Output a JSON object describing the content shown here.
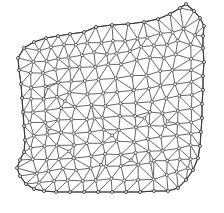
{
  "figure": {
    "title": "",
    "caption": "",
    "background_color": "#ffffff",
    "width": 224,
    "height": 213
  },
  "style": {
    "edge_color": "#4a4a4a",
    "boundary_edge_color": "#3a3a3a",
    "node_fill": "#ffffff",
    "node_stroke": "#333333",
    "edge_width": 0.85,
    "node_radius": 1.5
  },
  "chart_data": {
    "type": "scatter",
    "title": "",
    "xlabel": "",
    "ylabel": "",
    "grid": false,
    "legend": false,
    "xlim": [
      0,
      224
    ],
    "ylim": [
      0,
      213
    ],
    "node_count": 268,
    "boundary": [
      [
        84,
        32
      ],
      [
        96,
        27
      ],
      [
        112,
        25
      ],
      [
        128,
        24
      ],
      [
        144,
        22
      ],
      [
        158,
        19
      ],
      [
        170,
        14
      ],
      [
        180,
        8
      ],
      [
        186,
        4
      ],
      [
        194,
        11
      ],
      [
        200,
        18
      ],
      [
        204,
        26
      ],
      [
        203,
        36
      ],
      [
        203,
        48
      ],
      [
        204,
        62
      ],
      [
        203,
        76
      ],
      [
        203,
        90
      ],
      [
        202,
        104
      ],
      [
        202,
        118
      ],
      [
        201,
        132
      ],
      [
        200,
        146
      ],
      [
        198,
        158
      ],
      [
        193,
        170
      ],
      [
        186,
        180
      ],
      [
        178,
        188
      ],
      [
        168,
        191
      ],
      [
        154,
        191
      ],
      [
        140,
        192
      ],
      [
        126,
        192
      ],
      [
        112,
        192
      ],
      [
        98,
        192
      ],
      [
        84,
        192
      ],
      [
        70,
        192
      ],
      [
        56,
        192
      ],
      [
        44,
        191
      ],
      [
        34,
        189
      ],
      [
        26,
        184
      ],
      [
        20,
        176
      ],
      [
        17,
        168
      ],
      [
        20,
        160
      ],
      [
        24,
        152
      ],
      [
        25,
        140
      ],
      [
        24,
        126
      ],
      [
        23,
        112
      ],
      [
        22,
        98
      ],
      [
        21,
        84
      ],
      [
        19,
        70
      ],
      [
        18,
        58
      ],
      [
        24,
        48
      ],
      [
        34,
        42
      ],
      [
        46,
        38
      ],
      [
        58,
        36
      ],
      [
        70,
        34
      ]
    ],
    "interior_nodes": [
      [
        40,
        52
      ],
      [
        52,
        48
      ],
      [
        64,
        46
      ],
      [
        76,
        44
      ],
      [
        88,
        43
      ],
      [
        100,
        42
      ],
      [
        112,
        41
      ],
      [
        124,
        40
      ],
      [
        136,
        38
      ],
      [
        148,
        36
      ],
      [
        160,
        34
      ],
      [
        172,
        31
      ],
      [
        184,
        28
      ],
      [
        194,
        34
      ],
      [
        34,
        62
      ],
      [
        46,
        60
      ],
      [
        58,
        58
      ],
      [
        70,
        56
      ],
      [
        82,
        55
      ],
      [
        94,
        54
      ],
      [
        106,
        53
      ],
      [
        118,
        52
      ],
      [
        130,
        50
      ],
      [
        142,
        48
      ],
      [
        154,
        46
      ],
      [
        166,
        44
      ],
      [
        178,
        42
      ],
      [
        190,
        46
      ],
      [
        30,
        74
      ],
      [
        42,
        72
      ],
      [
        56,
        70
      ],
      [
        68,
        68
      ],
      [
        80,
        67
      ],
      [
        94,
        66
      ],
      [
        108,
        65
      ],
      [
        122,
        63
      ],
      [
        136,
        61
      ],
      [
        150,
        59
      ],
      [
        164,
        57
      ],
      [
        176,
        55
      ],
      [
        190,
        58
      ],
      [
        32,
        88
      ],
      [
        44,
        85
      ],
      [
        58,
        83
      ],
      [
        72,
        81
      ],
      [
        86,
        80
      ],
      [
        100,
        79
      ],
      [
        116,
        78
      ],
      [
        132,
        76
      ],
      [
        146,
        74
      ],
      [
        160,
        72
      ],
      [
        174,
        70
      ],
      [
        190,
        70
      ],
      [
        30,
        100
      ],
      [
        43,
        98
      ],
      [
        57,
        96
      ],
      [
        71,
        94
      ],
      [
        86,
        93
      ],
      [
        102,
        92
      ],
      [
        118,
        91
      ],
      [
        134,
        89
      ],
      [
        148,
        88
      ],
      [
        162,
        86
      ],
      [
        176,
        84
      ],
      [
        190,
        82
      ],
      [
        33,
        112
      ],
      [
        46,
        110
      ],
      [
        60,
        108
      ],
      [
        75,
        107
      ],
      [
        90,
        106
      ],
      [
        106,
        105
      ],
      [
        122,
        104
      ],
      [
        137,
        102
      ],
      [
        151,
        101
      ],
      [
        165,
        99
      ],
      [
        178,
        97
      ],
      [
        191,
        95
      ],
      [
        31,
        124
      ],
      [
        44,
        122
      ],
      [
        58,
        120
      ],
      [
        73,
        119
      ],
      [
        88,
        118
      ],
      [
        104,
        117
      ],
      [
        119,
        116
      ],
      [
        134,
        115
      ],
      [
        149,
        113
      ],
      [
        163,
        112
      ],
      [
        177,
        110
      ],
      [
        191,
        108
      ],
      [
        33,
        136
      ],
      [
        46,
        134
      ],
      [
        60,
        133
      ],
      [
        75,
        132
      ],
      [
        90,
        131
      ],
      [
        105,
        130
      ],
      [
        120,
        129
      ],
      [
        135,
        128
      ],
      [
        150,
        126
      ],
      [
        164,
        125
      ],
      [
        178,
        123
      ],
      [
        191,
        121
      ],
      [
        31,
        148
      ],
      [
        44,
        147
      ],
      [
        58,
        146
      ],
      [
        73,
        145
      ],
      [
        88,
        144
      ],
      [
        103,
        143
      ],
      [
        118,
        142
      ],
      [
        133,
        141
      ],
      [
        148,
        140
      ],
      [
        162,
        138
      ],
      [
        176,
        136
      ],
      [
        190,
        134
      ],
      [
        33,
        160
      ],
      [
        46,
        159
      ],
      [
        60,
        158
      ],
      [
        75,
        157
      ],
      [
        90,
        156
      ],
      [
        105,
        155
      ],
      [
        120,
        154
      ],
      [
        135,
        153
      ],
      [
        150,
        152
      ],
      [
        164,
        150
      ],
      [
        178,
        148
      ],
      [
        190,
        146
      ],
      [
        36,
        172
      ],
      [
        49,
        171
      ],
      [
        63,
        170
      ],
      [
        77,
        169
      ],
      [
        92,
        168
      ],
      [
        107,
        167
      ],
      [
        122,
        166
      ],
      [
        137,
        165
      ],
      [
        152,
        164
      ],
      [
        166,
        162
      ],
      [
        179,
        160
      ],
      [
        190,
        158
      ],
      [
        40,
        182
      ],
      [
        54,
        181
      ],
      [
        68,
        181
      ],
      [
        82,
        180
      ],
      [
        96,
        180
      ],
      [
        110,
        180
      ],
      [
        124,
        180
      ],
      [
        138,
        179
      ],
      [
        152,
        178
      ],
      [
        166,
        176
      ],
      [
        178,
        172
      ],
      [
        188,
        168
      ],
      [
        48,
        88
      ],
      [
        66,
        100
      ],
      [
        95,
        120
      ],
      [
        112,
        134
      ],
      [
        143,
        118
      ],
      [
        168,
        120
      ],
      [
        50,
        130
      ],
      [
        70,
        150
      ],
      [
        100,
        164
      ],
      [
        130,
        160
      ],
      [
        155,
        160
      ]
    ]
  }
}
